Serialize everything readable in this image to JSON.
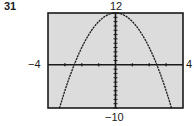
{
  "problem_number": "31",
  "window": {
    "xmin_label": "−4",
    "xmax_label": "4",
    "ymax_label": "12",
    "ymin_label": "−10"
  },
  "colors": {
    "plot_background": "#dcdcdc",
    "frame": "#1a1a1a",
    "curve": "#1a1a1a"
  },
  "chart_data": {
    "type": "line",
    "title": "31",
    "xlabel": "",
    "ylabel": "",
    "xlim": [
      -4,
      4
    ],
    "ylim": [
      -10,
      12
    ],
    "x_ticks": [
      -3,
      -2,
      -1,
      1,
      2,
      3
    ],
    "y_ticks_step": 1,
    "grid": false,
    "legend": null,
    "series": [
      {
        "name": "parabola (approx. y = 12 - 2x^2)",
        "x": [
          -3.32,
          -3,
          -2.5,
          -2.45,
          -2,
          -1.5,
          -1,
          -0.5,
          0,
          0.5,
          1,
          1.5,
          2,
          2.45,
          2.5,
          3,
          3.32
        ],
        "y": [
          -10,
          -6,
          -0.5,
          0,
          4,
          7.5,
          10,
          11.5,
          12,
          11.5,
          10,
          7.5,
          4,
          0,
          -0.5,
          -6,
          -10
        ]
      }
    ],
    "annotations": [
      "12",
      "−10",
      "−4",
      "4"
    ]
  }
}
